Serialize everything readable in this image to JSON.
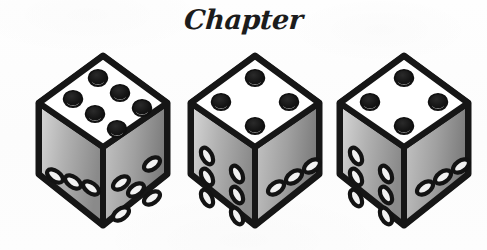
{
  "page": {
    "background_color": "#fdfdfd",
    "width": 487,
    "height": 250
  },
  "heading": {
    "text": "Chapter",
    "style": "bold script italic",
    "color": "#1c1c1c"
  },
  "illustration": {
    "name": "three-dice-illustration",
    "description": "Three isometric dice drawn in black-and-white halftone style",
    "count": 3,
    "colors": {
      "outline": "#161616",
      "top_face": "#ffffff",
      "left_face_light": "#d2d2d2",
      "left_face_dark": "#8e8e8e",
      "right_face_light": "#bdbdbd",
      "right_face_dark": "#7d7d7d",
      "top_pip": "#141414",
      "side_pip": "#f2f2f2"
    },
    "dice": [
      {
        "label": "die-1",
        "x": 28,
        "y": 48,
        "top_face_value": 6,
        "left_face_value": 3,
        "right_face_value": 5
      },
      {
        "label": "die-2",
        "x": 180,
        "y": 48,
        "top_face_value": 4,
        "left_face_value": 6,
        "right_face_value": 3
      },
      {
        "label": "die-3",
        "x": 329,
        "y": 48,
        "top_face_value": 4,
        "left_face_value": 6,
        "right_face_value": 3
      }
    ]
  }
}
